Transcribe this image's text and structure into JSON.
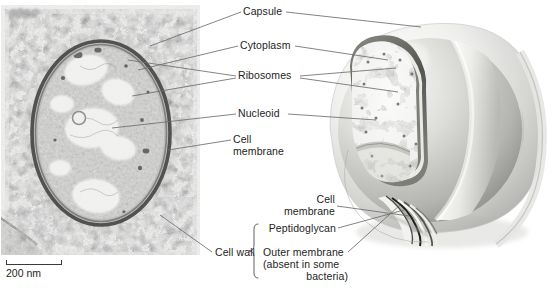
{
  "figure": {
    "background_color": "#ffffff",
    "text_color": "#242424",
    "leader_line_color": "#6e6e6e"
  },
  "micrograph": {
    "name": "transmission-electron-micrograph",
    "type": "grayscale TEM of a bacterial cell in cross section",
    "scalebar": {
      "label": "200 nm",
      "bar_length_px": 56
    }
  },
  "diagram": {
    "name": "cutaway-bacterium-illustration",
    "type": "grayscale 3D cutaway sphere with wedge removed showing internal layers"
  },
  "labels": {
    "capsule": "Capsule",
    "cytoplasm": "Cytoplasm",
    "ribosomes": "Ribosomes",
    "nucleoid": "Nucleoid",
    "cell_membrane_line1": "Cell",
    "cell_membrane_line2": "membrane",
    "cell_wall": "Cell wall",
    "cell_membrane_lower_line1": "Cell",
    "cell_membrane_lower_line2": "membrane",
    "peptidoglycan": "Peptidoglycan",
    "outer_membrane_line1": "Outer membrane",
    "outer_membrane_line2": "(absent in some",
    "outer_membrane_line3": "bacteria)"
  }
}
